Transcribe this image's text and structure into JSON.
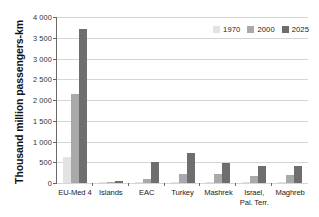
{
  "chart_data": {
    "type": "bar",
    "title": "",
    "xlabel": "",
    "ylabel": "Thousand million passengers-km",
    "ylim": [
      0,
      4000
    ],
    "ytick_labels": [
      "4 000",
      "3 500",
      "3 000",
      "2 500",
      "2 000",
      "1 500",
      "1 000",
      "500",
      "0"
    ],
    "ytick_values": [
      4000,
      3500,
      3000,
      2500,
      2000,
      1500,
      1000,
      500,
      0
    ],
    "grid": true,
    "legend_position": "top-right",
    "categories": [
      "EU-Med 4",
      "Islands",
      "EAC",
      "Turkey",
      "Mashrek",
      "Israel,\nPal. Terr.",
      "Maghreb"
    ],
    "series": [
      {
        "name": "1970",
        "color": "#e3e3e3",
        "values": [
          620,
          4,
          18,
          30,
          22,
          18,
          30
        ]
      },
      {
        "name": "2000",
        "color": "#a9a9a9",
        "values": [
          2150,
          18,
          85,
          215,
          225,
          175,
          195
        ]
      },
      {
        "name": "2025",
        "color": "#6e6e6e",
        "values": [
          3720,
          48,
          515,
          730,
          480,
          400,
          400
        ]
      }
    ]
  },
  "legend": {
    "items": [
      {
        "label": "1970",
        "color": "#e3e3e3"
      },
      {
        "label": "2000",
        "color": "#a9a9a9"
      },
      {
        "label": "2025",
        "color": "#6e6e6e"
      }
    ]
  }
}
